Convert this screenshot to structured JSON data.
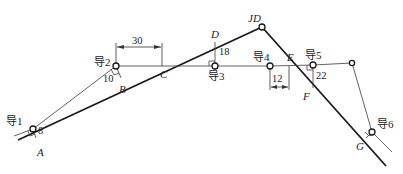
{
  "diagram": {
    "road_points": {
      "A": "A",
      "B": "B",
      "C": "C",
      "D": "D",
      "JD": "JD",
      "E": "E",
      "F": "F",
      "G": "G"
    },
    "traverse_points": {
      "p1": "导1",
      "p2": "导2",
      "p3": "导3",
      "p4": "导4",
      "p5": "导5",
      "p6": "导6"
    },
    "measurements": {
      "p1_to_A": "8",
      "p2_to_B": "10",
      "p2_to_C": "30",
      "p3_to_D": "18",
      "p4_to_E": "12",
      "p5_to_F": "22"
    },
    "colors": {
      "line": "#1a1a1a",
      "background": "#ffffff"
    }
  }
}
